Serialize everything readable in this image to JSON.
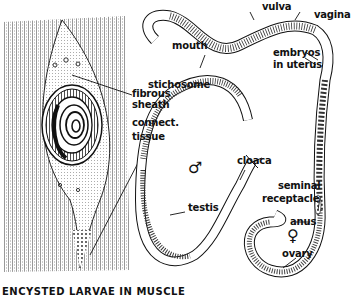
{
  "diagram": {
    "caption": "ENCYSTED LARVAE IN MUSCLE",
    "cyst_labels": {
      "fibrous_sheath": [
        "fibrous",
        "sheath"
      ],
      "connective_tissue": [
        "connect.",
        "tissue"
      ]
    },
    "male": {
      "symbol": "♂",
      "labels": {
        "mouth": "mouth",
        "stichosome": "stichosome",
        "testis": "testis",
        "cloaca": "cloaca"
      }
    },
    "female": {
      "symbol": "♀",
      "labels": {
        "vulva": "vulva",
        "vagina": "vagina",
        "embryos": [
          "embryos",
          "in uterus"
        ],
        "seminal_receptacle": [
          "seminal",
          "receptacle"
        ],
        "anus": "anus",
        "ovary": "ovary"
      }
    }
  }
}
